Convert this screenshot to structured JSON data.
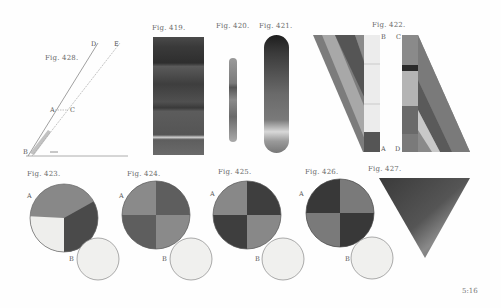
{
  "plate": {
    "number": "5:16",
    "background": "#fefefe"
  },
  "figures": [
    {
      "id": "fig428",
      "label": "Fig. 428.",
      "points": [
        "D",
        "E",
        "A",
        "C",
        "B"
      ]
    },
    {
      "id": "fig419",
      "label": "Fig. 419."
    },
    {
      "id": "fig420",
      "label": "Fig. 420."
    },
    {
      "id": "fig421",
      "label": "Fig. 421."
    },
    {
      "id": "fig422",
      "label": "Fig. 422.",
      "points": [
        "B",
        "C",
        "A",
        "D"
      ]
    },
    {
      "id": "fig423",
      "label": "Fig. 423.",
      "points": [
        "A",
        "B"
      ]
    },
    {
      "id": "fig424",
      "label": "Fig. 424.",
      "points": [
        "A",
        "B"
      ]
    },
    {
      "id": "fig425",
      "label": "Fig. 425.",
      "points": [
        "A",
        "B"
      ]
    },
    {
      "id": "fig426",
      "label": "Fig. 426.",
      "points": [
        "A",
        "B"
      ]
    },
    {
      "id": "fig427",
      "label": "Fig. 427."
    }
  ],
  "colors": {
    "dark": "#3c3c3c",
    "mid_dark": "#5a5a5a",
    "mid": "#7d7d7d",
    "light": "#9a9a9a",
    "pale": "#e8e8e6",
    "line": "#888888"
  }
}
